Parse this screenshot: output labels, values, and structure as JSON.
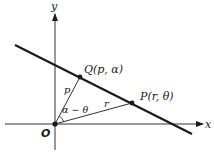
{
  "diagram": {
    "type": "polar-coordinate line geometry",
    "axes": {
      "x_label": "x",
      "y_label": "y",
      "origin_label": "O"
    },
    "points": {
      "Q": {
        "label": "Q(p, α)"
      },
      "P": {
        "label": "P(r, θ)"
      }
    },
    "segments": {
      "OQ_label": "p",
      "OP_label": "r",
      "angle_label": "α − θ"
    },
    "colors": {
      "ink": "#1a1a1a",
      "axis": "#333333",
      "background": "#ffffff"
    }
  }
}
